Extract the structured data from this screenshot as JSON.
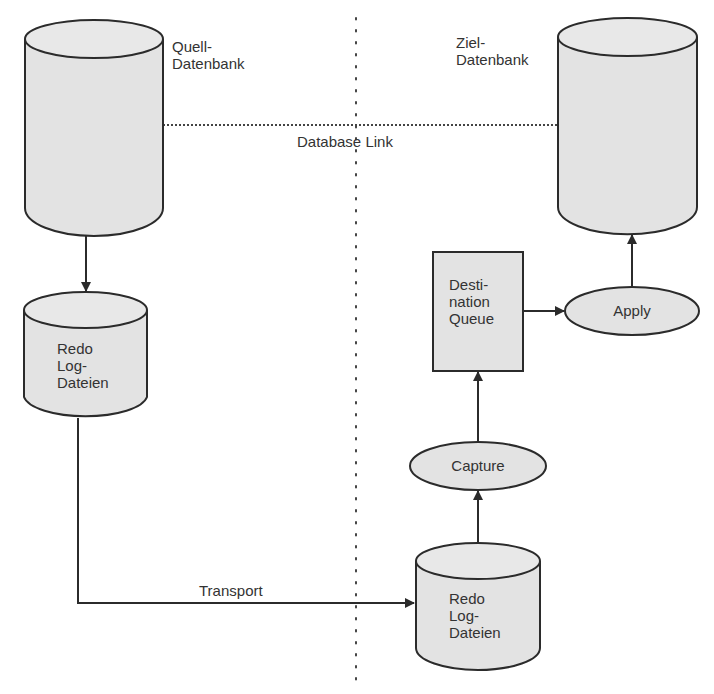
{
  "diagram": {
    "colors": {
      "fill": "#e3e3e3",
      "stroke": "#2b2b2b",
      "text": "#333333",
      "background": "#ffffff"
    },
    "nodes": {
      "source_db": {
        "label_line1": "Quell-",
        "label_line2": "Datenbank",
        "shape": "cylinder"
      },
      "target_db": {
        "label_line1": "Ziel-",
        "label_line2": "Datenbank",
        "shape": "cylinder"
      },
      "redo_source": {
        "line1": "Redo",
        "line2": "Log-",
        "line3": "Dateien",
        "shape": "cylinder"
      },
      "redo_target": {
        "line1": "Redo",
        "line2": "Log-",
        "line3": "Dateien",
        "shape": "cylinder"
      },
      "dest_queue": {
        "line1": "Desti-",
        "line2": "nation",
        "line3": "Queue",
        "shape": "rectangle"
      },
      "apply": {
        "label": "Apply",
        "shape": "ellipse"
      },
      "capture": {
        "label": "Capture",
        "shape": "ellipse"
      }
    },
    "edges": {
      "db_link": {
        "label": "Database Link",
        "style": "dotted",
        "from": "source_db",
        "to": "target_db"
      },
      "transport": {
        "label": "Transport",
        "from": "redo_source",
        "to": "redo_target"
      },
      "others": [
        {
          "from": "source_db",
          "to": "redo_source"
        },
        {
          "from": "redo_target",
          "to": "capture"
        },
        {
          "from": "capture",
          "to": "dest_queue"
        },
        {
          "from": "dest_queue",
          "to": "apply"
        },
        {
          "from": "apply",
          "to": "target_db"
        }
      ]
    },
    "separator": {
      "style": "dotted",
      "orientation": "vertical"
    }
  }
}
